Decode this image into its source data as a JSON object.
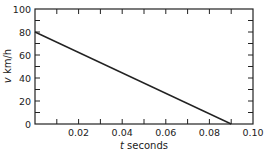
{
  "chart_data": {
    "type": "line",
    "title": "",
    "xlabel": "t seconds",
    "xlabel_var": "t",
    "xlabel_unit": "seconds",
    "ylabel": "v km/h",
    "ylabel_var": "v",
    "ylabel_unit": "km/h",
    "xlim": [
      0,
      0.1
    ],
    "ylim": [
      0,
      100
    ],
    "x_ticks_major": [
      0.02,
      0.04,
      0.06,
      0.08,
      0.1
    ],
    "x_tick_labels": [
      "0.02",
      "0.04",
      "0.06",
      "0.08",
      "0.10"
    ],
    "x_ticks_minor": [
      0.01,
      0.03,
      0.05,
      0.07,
      0.09
    ],
    "y_ticks_major": [
      0,
      20,
      40,
      60,
      80,
      100
    ],
    "y_tick_labels": [
      "0",
      "20",
      "40",
      "60",
      "80",
      "100"
    ],
    "y_ticks_minor": [
      10,
      30,
      50,
      70,
      90
    ],
    "grid": false,
    "legend": null,
    "series": [
      {
        "name": "v(t)",
        "x": [
          0,
          0.09
        ],
        "y": [
          80,
          0
        ],
        "color": "#222222"
      }
    ]
  }
}
